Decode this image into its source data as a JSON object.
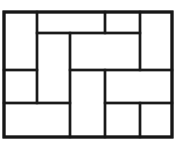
{
  "figure": {
    "canvas": {
      "width": 178,
      "height": 149
    },
    "colors": {
      "background": "#ffffff",
      "tile_fill": "#ffffff",
      "line": "#1a1a1a",
      "frame_line": "#161616"
    },
    "frame": {
      "x": 4,
      "y": 12,
      "width": 168,
      "height": 125,
      "stroke_width": 3.2
    },
    "guides": {
      "vertical_x": [
        4,
        37,
        70,
        105,
        140,
        172
      ],
      "horizontal_y": [
        12,
        33,
        70,
        103,
        137
      ]
    },
    "tile_stroke_width": 2.4,
    "tiles": [
      {
        "id": "tile-1",
        "name": "top-left-vertical",
        "x": 4,
        "y": 12,
        "w": 33,
        "h": 58,
        "orientation": "vertical"
      },
      {
        "id": "tile-2",
        "name": "top-center-horizontal",
        "x": 37,
        "y": 12,
        "w": 68,
        "h": 21,
        "orientation": "horizontal"
      },
      {
        "id": "tile-3",
        "name": "top-right-inner-small",
        "x": 105,
        "y": 12,
        "w": 35,
        "h": 21,
        "orientation": "horizontal"
      },
      {
        "id": "tile-4",
        "name": "top-right-vertical",
        "x": 140,
        "y": 12,
        "w": 32,
        "h": 58,
        "orientation": "vertical"
      },
      {
        "id": "tile-5",
        "name": "upper-mid-left-vertical",
        "x": 37,
        "y": 33,
        "w": 33,
        "h": 70,
        "orientation": "vertical"
      },
      {
        "id": "tile-6",
        "name": "upper-mid-center-horizontal",
        "x": 70,
        "y": 33,
        "w": 70,
        "h": 37,
        "orientation": "horizontal"
      },
      {
        "id": "tile-7",
        "name": "mid-left-horizontal",
        "x": 4,
        "y": 70,
        "w": 33,
        "h": 33,
        "orientation": "horizontal"
      },
      {
        "id": "tile-8",
        "name": "center-vertical",
        "x": 70,
        "y": 70,
        "w": 35,
        "h": 67,
        "orientation": "vertical"
      },
      {
        "id": "tile-9",
        "name": "mid-right-horizontal",
        "x": 105,
        "y": 70,
        "w": 67,
        "h": 33,
        "orientation": "horizontal"
      },
      {
        "id": "tile-10",
        "name": "bottom-left-horizontal",
        "x": 4,
        "y": 103,
        "w": 66,
        "h": 34,
        "orientation": "horizontal"
      },
      {
        "id": "tile-11",
        "name": "bottom-center-small",
        "x": 105,
        "y": 103,
        "w": 35,
        "h": 34,
        "orientation": "horizontal"
      },
      {
        "id": "tile-12",
        "name": "bottom-right-small",
        "x": 140,
        "y": 103,
        "w": 32,
        "h": 34,
        "orientation": "horizontal"
      }
    ]
  }
}
